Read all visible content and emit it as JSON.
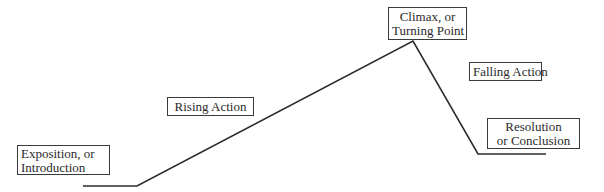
{
  "diagram": {
    "type": "plot-structure",
    "stages": [
      {
        "id": "exposition",
        "lines": [
          "Exposition, or",
          "Introduction"
        ]
      },
      {
        "id": "rising",
        "lines": [
          "Rising Action"
        ]
      },
      {
        "id": "climax",
        "lines": [
          "Climax, or",
          "Turning Point"
        ]
      },
      {
        "id": "falling",
        "lines": [
          "Falling Action"
        ]
      },
      {
        "id": "resolution",
        "lines": [
          "Resolution",
          "or Conclusion"
        ]
      }
    ],
    "line_color": "#2b2b2b",
    "path_points": [
      [
        83,
        186
      ],
      [
        137,
        186
      ],
      [
        413,
        41
      ],
      [
        478,
        154
      ],
      [
        546,
        154
      ]
    ]
  }
}
